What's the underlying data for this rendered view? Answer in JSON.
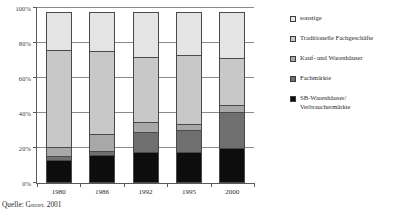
{
  "chart_data": {
    "type": "bar",
    "subtype": "stacked-100-percent",
    "title": "",
    "xlabel": "",
    "ylabel": "",
    "ylim": [
      0,
      100
    ],
    "ytick_labels": [
      "0%",
      "20%",
      "40%",
      "60%",
      "80%",
      "100%"
    ],
    "ytick_values": [
      0,
      20,
      40,
      60,
      80,
      100
    ],
    "grid": true,
    "legend_position": "right",
    "categories": [
      "1980",
      "1986",
      "1992",
      "1995",
      "2000"
    ],
    "series": [
      {
        "name": "SB-Warenhäuser/\nVerbrauchermärkte",
        "color": "#0d0d0d",
        "values": [
          13,
          16,
          18,
          18,
          20
        ]
      },
      {
        "name": "Fachmärkte",
        "color": "#6f6f6f",
        "values": [
          3,
          3,
          12,
          13,
          21
        ]
      },
      {
        "name": "Kauf- und Warenhäuser",
        "color": "#a8a8a8",
        "values": [
          6,
          10,
          6,
          4,
          5
        ]
      },
      {
        "name": "Traditionelle Fachgeschäfte",
        "color": "#c8c8c8",
        "values": [
          56,
          48,
          38,
          40,
          27
        ]
      },
      {
        "name": "sonstige",
        "color": "#e4e4e4",
        "values": [
          22,
          23,
          26,
          25,
          27
        ]
      }
    ]
  },
  "legend": {
    "items": [
      {
        "label": "sonstige",
        "color": "#e4e4e4"
      },
      {
        "label": "Traditionelle Fachgeschäfte",
        "color": "#c8c8c8"
      },
      {
        "label": "Kauf- und Warenhäuser",
        "color": "#a8a8a8"
      },
      {
        "label": "Fachmärkte",
        "color": "#6f6f6f"
      },
      {
        "label": "SB-Warenhäuser/\nVerbrauchermärkte",
        "color": "#0d0d0d"
      }
    ]
  },
  "source": {
    "prefix": "Quelle: ",
    "author": "Greipl",
    "year": " 2001"
  }
}
